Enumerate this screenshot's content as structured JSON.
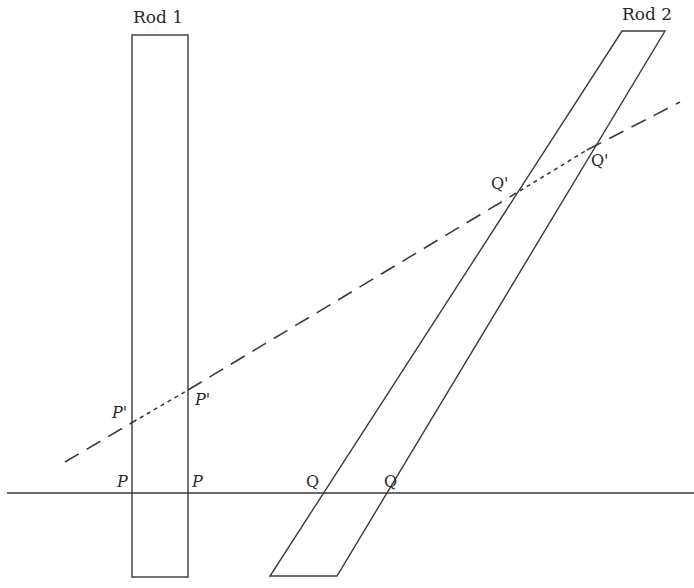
{
  "diagram": {
    "rods": [
      {
        "label": "Rod 1",
        "shape": "rectangle",
        "orientation": "vertical",
        "points": [
          [
            132,
            35
          ],
          [
            188,
            35
          ],
          [
            188,
            577
          ],
          [
            132,
            577
          ]
        ]
      },
      {
        "label": "Rod 2",
        "shape": "parallelogram",
        "orientation": "slanted",
        "points": [
          [
            622,
            31
          ],
          [
            665,
            31
          ],
          [
            337,
            576
          ],
          [
            270,
            576
          ]
        ]
      }
    ],
    "lines": {
      "horizontal": {
        "style": "solid",
        "from": [
          7,
          493
        ],
        "to": [
          694,
          493
        ]
      },
      "oblique": {
        "style": "dashed",
        "from": [
          65,
          462
        ],
        "to": [
          680,
          102
        ],
        "inside_rods_style": "dotted"
      }
    },
    "points": {
      "P_left": {
        "label": "P",
        "x": 133,
        "y": 493
      },
      "P_right": {
        "label": "P",
        "x": 188,
        "y": 493
      },
      "Pp_left": {
        "label": "P'",
        "x": 133,
        "y": 422
      },
      "Pp_right": {
        "label": "P'",
        "x": 188,
        "y": 390
      },
      "Q_left": {
        "label": "Q",
        "x": 326,
        "y": 493
      },
      "Q_right": {
        "label": "Q",
        "x": 373,
        "y": 493
      },
      "Qp_left": {
        "label": "Q'",
        "x": 513,
        "y": 195
      },
      "Qp_right": {
        "label": "Q'",
        "x": 587,
        "y": 150
      }
    },
    "colors": {
      "stroke": "#3a3a3a",
      "text": "#2a2a2a",
      "background": "#ffffff"
    }
  }
}
